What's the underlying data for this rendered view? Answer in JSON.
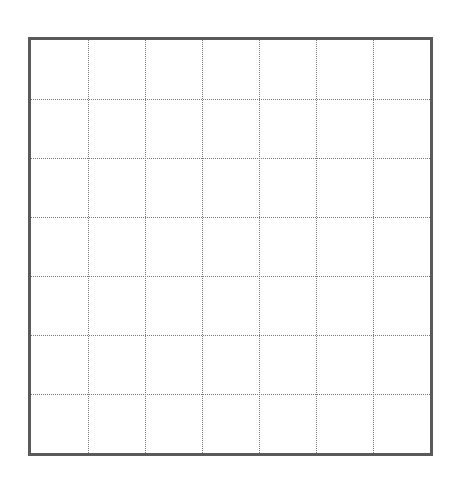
{
  "grid": {
    "rows": 7,
    "columns": 7,
    "frame_color": "#5a5a5a",
    "line_color": "#7a7a7a",
    "line_style": "dotted",
    "cells": []
  }
}
